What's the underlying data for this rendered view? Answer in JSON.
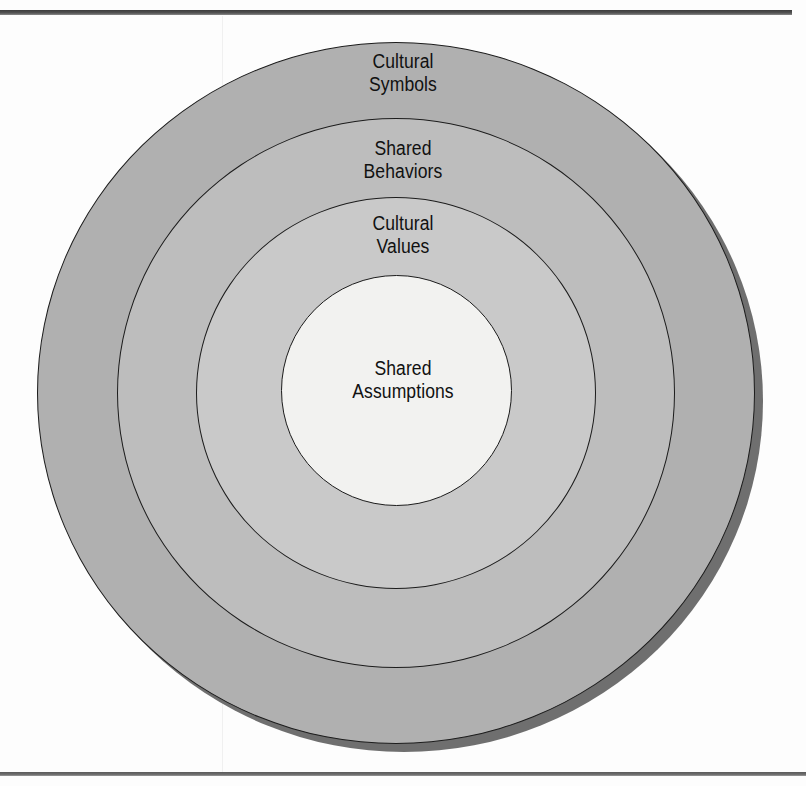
{
  "page": {
    "background_color": "#fdfdfd"
  },
  "rules": {
    "top_rule_color": "#3c3c3c",
    "bottom_rule_color": "#5a5a5a"
  },
  "diagram": {
    "type": "concentric-circles",
    "shadow_color": "#6f6f6f",
    "outline_color": "#1c1c1c",
    "layers": [
      {
        "index": 0,
        "label": "Cultural\nSymbols",
        "label_line1": "Cultural",
        "label_line2": "Symbols",
        "fill_color": "#b0b0b0",
        "level": "outermost"
      },
      {
        "index": 1,
        "label": "Shared\nBehaviors",
        "label_line1": "Shared",
        "label_line2": "Behaviors",
        "fill_color": "#bdbdbd",
        "level": "second"
      },
      {
        "index": 2,
        "label": "Cultural\nValues",
        "label_line1": "Cultural",
        "label_line2": "Values",
        "fill_color": "#c9c9c9",
        "level": "third"
      },
      {
        "index": 3,
        "label": "Shared\nAssumptions",
        "label_line1": "Shared",
        "label_line2": "Assumptions",
        "fill_color": "#f2f2f0",
        "level": "innermost"
      }
    ]
  }
}
